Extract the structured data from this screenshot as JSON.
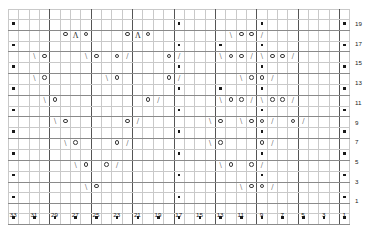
{
  "chart": {
    "type": "knitting-chart-grid",
    "columns": 33,
    "rows": 20,
    "cell_width_px": 10.35,
    "cell_height_px": 9.85,
    "column_numbers_position": "bottom",
    "row_numbers_position": "right",
    "column_numbers": [
      "33",
      "31",
      "29",
      "27",
      "25",
      "23",
      "21",
      "19",
      "17",
      "15",
      "13",
      "11",
      "9",
      "7",
      "5",
      "3",
      "1"
    ],
    "row_numbers": [
      "19",
      "17",
      "15",
      "13",
      "11",
      "9",
      "7",
      "5",
      "3",
      "1"
    ],
    "symbol_legend": {
      "purl": "▪",
      "yarn_over": "○",
      "ssk": "\\",
      "k2tog": "/",
      "cdd": "Λ",
      "knit": ""
    },
    "colors": {
      "grid_line": "#c9c9c9",
      "grid_line_bold": "#555555",
      "grid_line_row_bold": "#8a8a8a",
      "symbol": "#2b2b2b",
      "background": "#ffffff"
    }
  },
  "chart_data": {
    "type": "heatmap",
    "xlabel": "",
    "ylabel": "",
    "grid_on": true,
    "legend_position": "none",
    "x": [
      "33",
      "32",
      "31",
      "30",
      "29",
      "28",
      "27",
      "26",
      "25",
      "24",
      "23",
      "22",
      "21",
      "20",
      "19",
      "18",
      "17",
      "16",
      "15",
      "14",
      "13",
      "12",
      "11",
      "10",
      "9",
      "8",
      "7",
      "6",
      "5",
      "4",
      "3",
      "2",
      "1"
    ],
    "y": [
      "20",
      "19",
      "18",
      "17",
      "16",
      "15",
      "14",
      "13",
      "12",
      "11",
      "10",
      "9",
      "8",
      "7",
      "6",
      "5",
      "4",
      "3",
      "2",
      "1"
    ],
    "cells": [
      [
        "",
        "",
        "",
        "",
        "",
        "",
        "",
        "",
        "",
        "",
        "",
        "",
        "",
        "",
        "",
        "",
        "",
        "",
        "",
        "",
        "",
        "",
        "",
        "",
        "",
        "",
        "",
        "",
        "",
        "",
        "",
        "",
        ""
      ],
      [
        "p",
        "",
        "",
        "",
        "",
        "",
        "",
        "",
        "",
        "",
        "",
        "",
        "",
        "",
        "",
        "",
        "p",
        "",
        "",
        "",
        "",
        "",
        "",
        "",
        "p",
        "",
        "",
        "",
        "",
        "",
        "",
        "",
        "p"
      ],
      [
        "",
        "",
        "",
        "",
        "",
        "o",
        "A",
        "o",
        "",
        "",
        "",
        "o",
        "A",
        "o",
        "",
        "",
        "",
        "",
        "",
        "",
        "",
        "s",
        "o",
        "o",
        "k",
        "",
        "",
        "",
        "",
        "",
        "",
        "",
        ""
      ],
      [
        "p",
        "",
        "",
        "",
        "",
        "",
        "",
        "",
        "",
        "",
        "",
        "",
        "",
        "",
        "",
        "",
        "p",
        "",
        "",
        "",
        "p",
        "",
        "",
        "",
        "p",
        "",
        "",
        "",
        "",
        "",
        "",
        "",
        "p"
      ],
      [
        "",
        "",
        "s",
        "o",
        "",
        "",
        "",
        "s",
        "o",
        "",
        "o",
        "k",
        "",
        "",
        "",
        "o",
        "k",
        "",
        "",
        "",
        "s",
        "o",
        "o",
        "k",
        "s",
        "o",
        "o",
        "k",
        "",
        "",
        "",
        "",
        ""
      ],
      [
        "p",
        "",
        "",
        "",
        "",
        "",
        "",
        "",
        "",
        "",
        "",
        "",
        "",
        "",
        "",
        "",
        "p",
        "",
        "",
        "",
        "",
        "",
        "",
        "",
        "p",
        "",
        "",
        "",
        "",
        "",
        "",
        "",
        "p"
      ],
      [
        "",
        "",
        "s",
        "o",
        "",
        "",
        "",
        "",
        "",
        "s",
        "o",
        "",
        "",
        "",
        "",
        "o",
        "k",
        "",
        "",
        "",
        "",
        "",
        "s",
        "o",
        "o",
        "k",
        "",
        "",
        "",
        "",
        "",
        "",
        ""
      ],
      [
        "p",
        "",
        "",
        "",
        "",
        "",
        "",
        "",
        "",
        "",
        "",
        "",
        "",
        "",
        "",
        "",
        "p",
        "",
        "",
        "",
        "p",
        "",
        "",
        "",
        "p",
        "",
        "",
        "",
        "",
        "",
        "",
        "",
        "p"
      ],
      [
        "",
        "",
        "",
        "s",
        "o",
        "",
        "",
        "",
        "",
        "",
        "",
        "",
        "",
        "o",
        "k",
        "",
        "",
        "",
        "",
        "",
        "s",
        "o",
        "o",
        "k",
        "s",
        "o",
        "o",
        "k",
        "",
        "",
        "",
        "",
        ""
      ],
      [
        "p",
        "",
        "",
        "",
        "",
        "",
        "",
        "",
        "",
        "",
        "",
        "",
        "",
        "",
        "",
        "",
        "p",
        "",
        "",
        "",
        "",
        "",
        "",
        "",
        "p",
        "",
        "",
        "",
        "",
        "",
        "",
        "",
        "p"
      ],
      [
        "",
        "",
        "",
        "",
        "s",
        "o",
        "",
        "",
        "",
        "",
        "",
        "o",
        "k",
        "",
        "",
        "",
        "",
        "",
        "",
        "s",
        "o",
        "",
        "s",
        "o",
        "o",
        "k",
        "",
        "o",
        "k",
        "",
        "",
        "",
        ""
      ],
      [
        "p",
        "",
        "",
        "",
        "",
        "",
        "",
        "",
        "",
        "",
        "",
        "",
        "",
        "",
        "",
        "",
        "p",
        "",
        "",
        "",
        "",
        "",
        "",
        "",
        "p",
        "",
        "",
        "",
        "",
        "",
        "",
        "",
        "p"
      ],
      [
        "",
        "",
        "",
        "",
        "",
        "s",
        "o",
        "",
        "",
        "",
        "o",
        "k",
        "",
        "",
        "",
        "",
        "",
        "",
        "",
        "s",
        "o",
        "",
        "",
        "",
        "o",
        "k",
        "",
        "",
        "",
        "",
        "",
        "",
        ""
      ],
      [
        "p",
        "",
        "",
        "",
        "",
        "",
        "",
        "",
        "",
        "",
        "",
        "",
        "",
        "",
        "",
        "",
        "p",
        "",
        "",
        "",
        "",
        "",
        "",
        "",
        "p",
        "",
        "",
        "",
        "",
        "",
        "",
        "",
        "p"
      ],
      [
        "",
        "",
        "",
        "",
        "",
        "",
        "s",
        "o",
        "",
        "o",
        "k",
        "",
        "",
        "",
        "",
        "",
        "",
        "",
        "",
        "",
        "s",
        "o",
        "",
        "o",
        "k",
        "",
        "",
        "",
        "",
        "",
        "",
        "",
        ""
      ],
      [
        "p",
        "",
        "",
        "",
        "",
        "",
        "",
        "",
        "",
        "",
        "",
        "",
        "",
        "",
        "",
        "",
        "p",
        "",
        "",
        "",
        "",
        "",
        "",
        "",
        "p",
        "",
        "",
        "",
        "",
        "",
        "",
        "",
        "p"
      ],
      [
        "",
        "",
        "",
        "",
        "",
        "",
        "",
        "s",
        "o",
        "",
        "",
        "",
        "",
        "",
        "",
        "",
        "",
        "",
        "",
        "",
        "",
        "",
        "s",
        "o",
        "o",
        "k",
        "",
        "",
        "",
        "",
        "",
        "",
        ""
      ],
      [
        "p",
        "",
        "",
        "",
        "",
        "",
        "",
        "",
        "",
        "",
        "",
        "",
        "",
        "",
        "",
        "",
        "p",
        "",
        "",
        "",
        "",
        "",
        "",
        "",
        "",
        "",
        "",
        "",
        "",
        "",
        "",
        "",
        "p"
      ],
      [
        "",
        "",
        "",
        "",
        "",
        "",
        "",
        "",
        "",
        "",
        "",
        "",
        "",
        "",
        "",
        "",
        "",
        "",
        "",
        "",
        "",
        "",
        "",
        "",
        "",
        "",
        "",
        "",
        "",
        "",
        "",
        "",
        ""
      ],
      [
        "p",
        "",
        "p",
        "",
        "p",
        "",
        "p",
        "",
        "p",
        "",
        "p",
        "",
        "p",
        "",
        "p",
        "",
        "p",
        "",
        "p",
        "",
        "p",
        "",
        "p",
        "",
        "p",
        "",
        "p",
        "",
        "p",
        "",
        "p",
        "",
        "p"
      ]
    ]
  }
}
